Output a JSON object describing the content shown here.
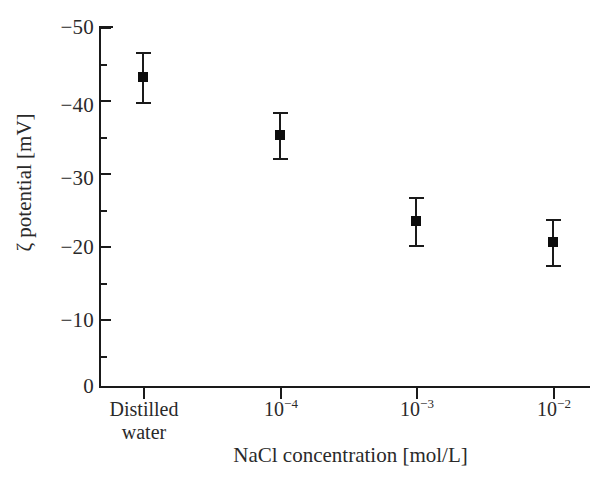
{
  "chart_data": {
    "type": "scatter",
    "title": "",
    "xlabel": "NaCl concentration [mol/L]",
    "ylabel": "ζ potential [mV]",
    "categories": [
      "Distilled water",
      "10⁻⁴",
      "10⁻³",
      "10⁻²"
    ],
    "values": [
      -43,
      -35,
      -23,
      -20
    ],
    "error_upper": [
      3.5,
      3.2,
      3.3,
      3.2
    ],
    "error_lower": [
      3.5,
      3.2,
      3.3,
      3.2
    ],
    "ylim": [
      -50,
      0
    ],
    "y_ticks_major": [
      -50,
      -40,
      -30,
      -20,
      -10,
      0
    ],
    "y_ticks_minor": [
      -45,
      -35,
      -25,
      -15,
      -5
    ],
    "grid": false,
    "legend": "none",
    "marker": "filled-square",
    "marker_color": "#0d0d0d",
    "axis_color": "#1a1a1a"
  },
  "axes": {
    "y_title": "ζ potential [mV]",
    "x_title": "NaCl concentration [mol/L]",
    "y_tick_labels": [
      "−50",
      "−40",
      "−30",
      "−20",
      "−10",
      "0"
    ],
    "x_tick_labels": [
      {
        "line1": "Distilled",
        "line2": "water",
        "base": "",
        "exp": ""
      },
      {
        "line1": "",
        "line2": "",
        "base": "10",
        "exp": "−4"
      },
      {
        "line1": "",
        "line2": "",
        "base": "10",
        "exp": "−3"
      },
      {
        "line1": "",
        "line2": "",
        "base": "10",
        "exp": "−2"
      }
    ]
  }
}
